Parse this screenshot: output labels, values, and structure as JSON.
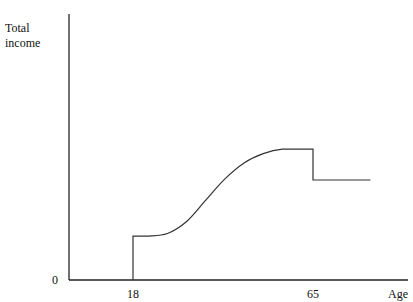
{
  "chart_data": {
    "type": "line",
    "title": "",
    "xlabel": "Age",
    "ylabel": "Total income",
    "origin_label": "0",
    "x_ticks": [
      {
        "value": 18,
        "label": "18"
      },
      {
        "value": 65,
        "label": "65"
      }
    ],
    "xlim": [
      0,
      88
    ],
    "ylim": [
      0,
      100
    ],
    "grid": false,
    "legend": "none",
    "series": [
      {
        "name": "Total income",
        "points": [
          {
            "x": 18,
            "y": 0
          },
          {
            "x": 18,
            "y": 16.5
          },
          {
            "x": 22,
            "y": 16.5
          },
          {
            "x": 27,
            "y": 17.5
          },
          {
            "x": 32,
            "y": 22
          },
          {
            "x": 37,
            "y": 30
          },
          {
            "x": 42,
            "y": 38
          },
          {
            "x": 47,
            "y": 44
          },
          {
            "x": 52,
            "y": 47.5
          },
          {
            "x": 57,
            "y": 49.2
          },
          {
            "x": 65,
            "y": 49.2
          },
          {
            "x": 65,
            "y": 37.6
          },
          {
            "x": 80,
            "y": 37.6
          }
        ]
      }
    ]
  }
}
